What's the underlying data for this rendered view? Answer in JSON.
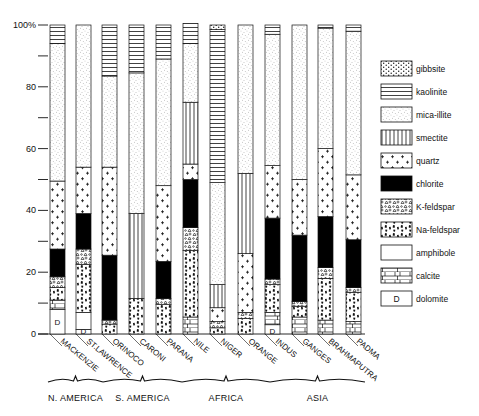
{
  "chart_data": {
    "type": "bar",
    "stacked": true,
    "title": "",
    "xlabel": "",
    "ylabel": "",
    "ylim": [
      0,
      100
    ],
    "y_ticks": [
      0,
      10,
      20,
      30,
      40,
      50,
      60,
      70,
      80,
      90,
      100
    ],
    "y_tick_labels": [
      "0",
      "",
      "20",
      "",
      "40",
      "",
      "60",
      "",
      "80",
      "",
      "100%"
    ],
    "grid": false,
    "legend_position": "right",
    "categories": [
      "MACKENZIE",
      "ST.LAWRENCE",
      "ORINOCO",
      "CARONI",
      "PARANA",
      "NILE",
      "NIGER",
      "ORANGE",
      "INDUS",
      "GANGES",
      "BRAHMAPUTRA",
      "PADMA"
    ],
    "regions": [
      {
        "label": "N. AMERICA",
        "categories": [
          "MACKENZIE",
          "ST.LAWRENCE"
        ]
      },
      {
        "label": "S. AMERICA",
        "categories": [
          "ORINOCO",
          "CARONI",
          "PARANA"
        ]
      },
      {
        "label": "AFRICA",
        "categories": [
          "NILE",
          "NIGER",
          "ORANGE"
        ]
      },
      {
        "label": "ASIA",
        "categories": [
          "INDUS",
          "GANGES",
          "BRAHMAPUTRA",
          "PADMA"
        ]
      }
    ],
    "series": [
      {
        "name": "dolomite",
        "pattern": "dolomite",
        "values": [
          8,
          1.5,
          0,
          0,
          0,
          0,
          0,
          0,
          3,
          0,
          0,
          0
        ]
      },
      {
        "name": "calcite",
        "pattern": "calcite",
        "values": [
          3,
          0,
          0,
          0,
          0,
          5.5,
          0,
          0,
          4,
          5.5,
          4.5,
          4
        ]
      },
      {
        "name": "amphibole",
        "pattern": "amphibole",
        "values": [
          0,
          5.5,
          0,
          0,
          0,
          0,
          0,
          0,
          0,
          0,
          0,
          0
        ]
      },
      {
        "name": "Na-feldspar",
        "pattern": "nafeld",
        "values": [
          4,
          15.5,
          3.2,
          11.5,
          9.5,
          21.5,
          2,
          5,
          9,
          3.5,
          13.5,
          9.5
        ]
      },
      {
        "name": "K-feldspar",
        "pattern": "kfeld",
        "values": [
          3.5,
          5,
          1.3,
          0,
          2,
          7.5,
          2,
          2,
          1.8,
          1.5,
          3.5,
          1.5
        ]
      },
      {
        "name": "chlorite",
        "pattern": "chlorite",
        "values": [
          9,
          11.5,
          21,
          0,
          12,
          15.5,
          0,
          0,
          19.7,
          21.5,
          16.5,
          15.5
        ]
      },
      {
        "name": "quartz",
        "pattern": "quartz",
        "values": [
          22,
          15,
          28.5,
          0,
          24.5,
          5,
          4.5,
          19,
          17,
          18,
          22,
          21
        ]
      },
      {
        "name": "smectite",
        "pattern": "smectite",
        "values": [
          0,
          0,
          0,
          27.5,
          0,
          20,
          7.5,
          26,
          0,
          0,
          0,
          0
        ]
      },
      {
        "name": "mica-illite",
        "pattern": "mica",
        "values": [
          44.5,
          46,
          29.5,
          45.5,
          41,
          19,
          33,
          48,
          42.5,
          50,
          39,
          46.5
        ]
      },
      {
        "name": "kaolinite",
        "pattern": "kaolinite",
        "values": [
          6,
          0,
          16.5,
          15.5,
          11,
          6.5,
          49.5,
          0,
          3,
          0,
          1,
          2
        ]
      },
      {
        "name": "gibbsite",
        "pattern": "gibbsite",
        "values": [
          0,
          0,
          0,
          0,
          0,
          0,
          1.5,
          0,
          0,
          0,
          0,
          0
        ]
      }
    ],
    "legend": [
      "gibbsite",
      "kaolinite",
      "mica-illite",
      "smectite",
      "quartz",
      "chlorite",
      "K-feldspar",
      "Na-feldspar",
      "amphibole",
      "calcite",
      "dolomite"
    ]
  },
  "labels": {
    "dolomite_glyph": "D"
  }
}
